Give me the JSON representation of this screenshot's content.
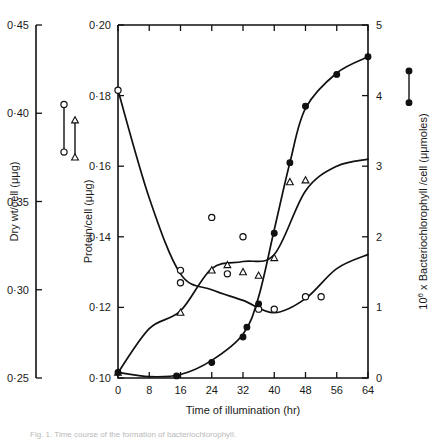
{
  "figure": {
    "caption": "Fig. 1. Time course of the formation of bacteriochlorophyll.",
    "background": "#ffffff",
    "ink_color": "#111111"
  },
  "chart_data": {
    "type": "line",
    "title": "",
    "xlabel": "Time of illumination (hr)",
    "xlim": [
      0,
      64
    ],
    "xticks": [
      0,
      8,
      16,
      24,
      32,
      40,
      48,
      56,
      64
    ],
    "xticklabels": [
      "0",
      "8",
      "16",
      "24",
      "32",
      "40",
      "48",
      "56",
      "64"
    ],
    "grid": false,
    "legend": "inline-markers-left-and-right",
    "axes": [
      {
        "id": "dry-weight",
        "position": "outer-left",
        "label": "Dry wt/cell (μμg)",
        "lim": [
          0.25,
          0.45
        ],
        "ticks": [
          0.25,
          0.3,
          0.35,
          0.4,
          0.45
        ],
        "ticklabels": [
          "0·25",
          "0·30",
          "0·35",
          "0·40",
          "0·45"
        ],
        "marker": "open-circle"
      },
      {
        "id": "protein",
        "position": "inner-left",
        "label": "Protein/cell (μμg)",
        "lim": [
          0.1,
          0.2
        ],
        "ticks": [
          0.1,
          0.12,
          0.14,
          0.16,
          0.18,
          0.2
        ],
        "ticklabels": [
          "0·10",
          "0·12",
          "0·14",
          "0·16",
          "0·18",
          "0·20"
        ],
        "marker": "triangle"
      },
      {
        "id": "bacteriochlorophyll",
        "position": "right",
        "label": "10⁶ x Bacteriochlorophyll /cell (μμmoles)",
        "label_prefix": "10",
        "label_exponent": "6",
        "label_rest": " x Bacteriochlorophyll /cell (μμmoles)",
        "lim": [
          0,
          5
        ],
        "ticks": [
          0,
          1,
          2,
          3,
          4,
          5
        ],
        "ticklabels": [
          "0",
          "1",
          "2",
          "3",
          "4",
          "5"
        ],
        "marker": "filled-circle"
      }
    ],
    "series": [
      {
        "name": "Dry wt/cell",
        "axis": "dry-weight",
        "marker": "open-circle",
        "units": "μμg",
        "points": [
          {
            "x": 0,
            "y": 0.413
          },
          {
            "x": 16,
            "y": 0.311
          },
          {
            "x": 16,
            "y": 0.304
          },
          {
            "x": 24,
            "y": 0.341
          },
          {
            "x": 28,
            "y": 0.309
          },
          {
            "x": 32,
            "y": 0.33
          },
          {
            "x": 36,
            "y": 0.289
          },
          {
            "x": 40,
            "y": 0.289
          },
          {
            "x": 48,
            "y": 0.296
          },
          {
            "x": 52,
            "y": 0.296
          }
        ],
        "curve": [
          {
            "x": 0,
            "y": 0.413
          },
          {
            "x": 8,
            "y": 0.352
          },
          {
            "x": 16,
            "y": 0.309
          },
          {
            "x": 24,
            "y": 0.3
          },
          {
            "x": 32,
            "y": 0.294
          },
          {
            "x": 40,
            "y": 0.287
          },
          {
            "x": 48,
            "y": 0.295
          },
          {
            "x": 56,
            "y": 0.312
          },
          {
            "x": 64,
            "y": 0.32
          }
        ]
      },
      {
        "name": "Protein/cell",
        "axis": "protein",
        "marker": "triangle",
        "units": "μμg",
        "points": [
          {
            "x": 0,
            "y": 0.1015
          },
          {
            "x": 16,
            "y": 0.1185
          },
          {
            "x": 24,
            "y": 0.1305
          },
          {
            "x": 28,
            "y": 0.132
          },
          {
            "x": 32,
            "y": 0.13
          },
          {
            "x": 36,
            "y": 0.129
          },
          {
            "x": 40,
            "y": 0.134
          },
          {
            "x": 44,
            "y": 0.1555
          },
          {
            "x": 48,
            "y": 0.156
          }
        ],
        "curve": [
          {
            "x": 0,
            "y": 0.1015
          },
          {
            "x": 8,
            "y": 0.114
          },
          {
            "x": 16,
            "y": 0.119
          },
          {
            "x": 24,
            "y": 0.131
          },
          {
            "x": 32,
            "y": 0.133
          },
          {
            "x": 40,
            "y": 0.135
          },
          {
            "x": 48,
            "y": 0.153
          },
          {
            "x": 56,
            "y": 0.16
          },
          {
            "x": 64,
            "y": 0.162
          }
        ]
      },
      {
        "name": "Bacteriochlorophyll/cell",
        "axis": "bacteriochlorophyll",
        "marker": "filled-circle",
        "units": "μμmoles",
        "points": [
          {
            "x": 0,
            "y": 0.08
          },
          {
            "x": 15,
            "y": 0.03
          },
          {
            "x": 24,
            "y": 0.22
          },
          {
            "x": 32,
            "y": 0.58
          },
          {
            "x": 33,
            "y": 0.72
          },
          {
            "x": 36,
            "y": 1.05
          },
          {
            "x": 40,
            "y": 2.05
          },
          {
            "x": 44,
            "y": 3.05
          },
          {
            "x": 48,
            "y": 3.85
          },
          {
            "x": 56,
            "y": 4.3
          },
          {
            "x": 64,
            "y": 4.55
          }
        ],
        "curve": [
          {
            "x": 0,
            "y": 0.08
          },
          {
            "x": 8,
            "y": 0.02
          },
          {
            "x": 16,
            "y": 0.05
          },
          {
            "x": 24,
            "y": 0.25
          },
          {
            "x": 32,
            "y": 0.62
          },
          {
            "x": 36,
            "y": 1.15
          },
          {
            "x": 40,
            "y": 2.1
          },
          {
            "x": 44,
            "y": 3.05
          },
          {
            "x": 48,
            "y": 3.82
          },
          {
            "x": 56,
            "y": 4.32
          },
          {
            "x": 64,
            "y": 4.55
          }
        ]
      }
    ],
    "legend_markers": [
      {
        "for": "dry-weight",
        "marker": "open-circle",
        "top_value": 0.405,
        "bottom_value": 0.378
      },
      {
        "for": "protein",
        "marker": "triangle",
        "top_value": 0.173,
        "bottom_value": 0.1625
      },
      {
        "for": "bacteriochlorophyll",
        "marker": "filled-circle",
        "top_value": 4.35,
        "bottom_value": 3.9
      }
    ]
  }
}
